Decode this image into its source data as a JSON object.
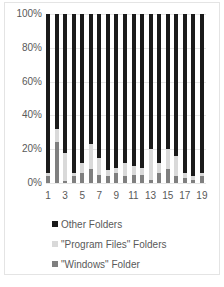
{
  "chart_data": {
    "type": "bar",
    "stacked": "percent",
    "title": "",
    "xlabel": "",
    "ylabel": "",
    "ylim": [
      0,
      100
    ],
    "y_ticks": [
      "0%",
      "20%",
      "40%",
      "60%",
      "80%",
      "100%"
    ],
    "x_tick_labels": [
      "1",
      "3",
      "5",
      "7",
      "9",
      "11",
      "13",
      "15",
      "17",
      "19"
    ],
    "categories": [
      "1",
      "2",
      "3",
      "4",
      "5",
      "6",
      "7",
      "8",
      "9",
      "10",
      "11",
      "12",
      "13",
      "14",
      "15",
      "16",
      "17",
      "18",
      "19"
    ],
    "grid": true,
    "legend_position": "bottom",
    "series": [
      {
        "name": "\"Windows\" Folder",
        "color": "#7f7f7f",
        "values": [
          4,
          24,
          1,
          4,
          6,
          8,
          5,
          4,
          6,
          4,
          5,
          5,
          2,
          6,
          8,
          4,
          3,
          2,
          4
        ]
      },
      {
        "name": "\"Program Files\" Folders",
        "color": "#d9d9d9",
        "values": [
          2,
          8,
          17,
          2,
          6,
          15,
          10,
          4,
          3,
          8,
          5,
          4,
          18,
          6,
          12,
          12,
          3,
          2,
          2
        ]
      },
      {
        "name": "Other Folders",
        "color": "#1a1a1a",
        "values": [
          94,
          68,
          82,
          94,
          88,
          77,
          85,
          92,
          91,
          88,
          90,
          91,
          80,
          88,
          80,
          84,
          94,
          96,
          94
        ]
      }
    ]
  },
  "legend": {
    "items": [
      {
        "label": "Other Folders",
        "color": "#1a1a1a"
      },
      {
        "label": "\"Program Files\" Folders",
        "color": "#d9d9d9"
      },
      {
        "label": "\"Windows\" Folder",
        "color": "#7f7f7f"
      }
    ]
  }
}
